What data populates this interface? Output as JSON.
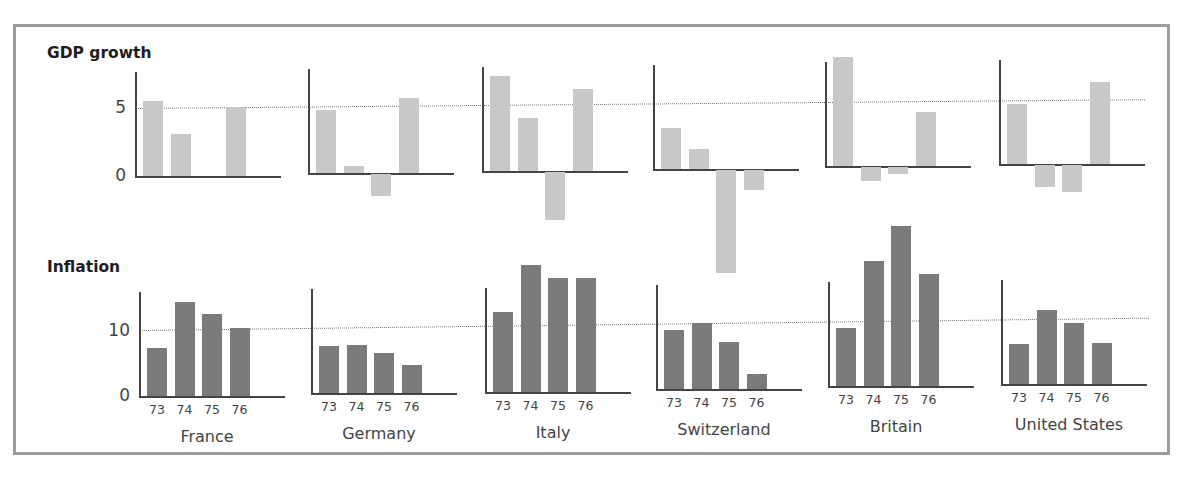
{
  "chart_data": [
    {
      "type": "bar",
      "title": "GDP growth",
      "ylabel": "",
      "yticks": [
        0,
        5
      ],
      "reference_line": 5,
      "years": [
        "73",
        "74",
        "75",
        "76"
      ],
      "bar_color": "#c8c8c8",
      "series": [
        {
          "name": "France",
          "values": [
            5.5,
            3.1,
            0.0,
            5.1
          ]
        },
        {
          "name": "Germany",
          "values": [
            4.6,
            0.5,
            -1.6,
            5.5
          ]
        },
        {
          "name": "Italy",
          "values": [
            7.0,
            3.9,
            -3.5,
            6.0
          ]
        },
        {
          "name": "Switzerland",
          "values": [
            3.0,
            1.5,
            -7.6,
            -1.5
          ]
        },
        {
          "name": "Britain",
          "values": [
            8.0,
            -1.0,
            -0.5,
            4.0
          ]
        },
        {
          "name": "United States",
          "values": [
            4.4,
            -1.6,
            -2.0,
            6.0
          ]
        }
      ]
    },
    {
      "type": "bar",
      "title": "Inflation",
      "ylabel": "",
      "yticks": [
        0,
        10
      ],
      "reference_line": 10,
      "years": [
        "73",
        "74",
        "75",
        "76"
      ],
      "bar_color": "#7a7a7a",
      "series": [
        {
          "name": "France",
          "values": [
            7.2,
            14.3,
            12.5,
            10.3
          ]
        },
        {
          "name": "Germany",
          "values": [
            7.1,
            7.2,
            6.0,
            4.3
          ]
        },
        {
          "name": "Italy",
          "values": [
            12.1,
            19.3,
            17.2,
            17.2
          ]
        },
        {
          "name": "Switzerland",
          "values": [
            9.0,
            10.0,
            7.1,
            2.2
          ]
        },
        {
          "name": "Britain",
          "values": [
            8.8,
            19.0,
            24.2,
            17.0
          ]
        },
        {
          "name": "United States",
          "values": [
            6.1,
            11.2,
            9.2,
            6.2
          ]
        }
      ]
    }
  ],
  "labels": {
    "gdp_title": "GDP growth",
    "inflation_title": "Inflation",
    "gdp_tick_0": "0",
    "gdp_tick_5": "5",
    "infl_tick_0": "0",
    "infl_tick_10": "10",
    "countries": [
      "France",
      "Germany",
      "Italy",
      "Switzerland",
      "Britain",
      "United States"
    ],
    "years": [
      "73",
      "74",
      "75",
      "76"
    ]
  }
}
